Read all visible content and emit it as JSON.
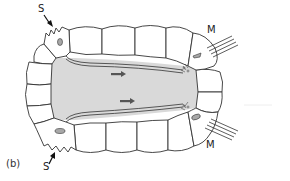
{
  "figure": {
    "panel_label": "(b)",
    "labels": {
      "sensory_top": "S",
      "sensory_bottom": "S",
      "motor_top": "M",
      "motor_bottom": "M"
    },
    "colors": {
      "lumen": "#d9d9d9",
      "cell_fill": "#ffffff",
      "outline": "#333333",
      "nucleus": "#a8a8a8",
      "arrow": "#555555"
    },
    "arrows": [
      {
        "direction": "right",
        "position": "upper-lumen"
      },
      {
        "direction": "right",
        "position": "lower-lumen"
      }
    ]
  }
}
